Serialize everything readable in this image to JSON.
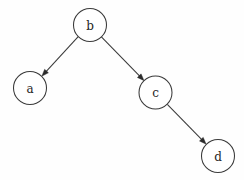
{
  "diagram": {
    "type": "directed-tree",
    "canvas": {
      "width": 244,
      "height": 180,
      "background": "#fefefe"
    },
    "style": {
      "node_fill": "#ffffff",
      "node_stroke": "#3a3a3a",
      "edge_stroke": "#3a3a3a",
      "label_color": "#1e1e1e",
      "node_radius": 16.5,
      "stroke_width": 1.05
    },
    "nodes": [
      {
        "id": "b",
        "label": "b",
        "cx": 90,
        "cy": 25,
        "r": 16.5,
        "role": "root"
      },
      {
        "id": "a",
        "label": "a",
        "cx": 30,
        "cy": 88,
        "r": 16.5,
        "role": "leaf"
      },
      {
        "id": "c",
        "label": "c",
        "cx": 155.5,
        "cy": 92.5,
        "r": 16.5,
        "role": "internal"
      },
      {
        "id": "d",
        "label": "d",
        "cx": 218,
        "cy": 156,
        "r": 16.5,
        "role": "leaf"
      }
    ],
    "edges": [
      {
        "id": "b-a",
        "from": "b",
        "to": "a",
        "directed": true,
        "x1": 78.2,
        "y1": 36.6,
        "x2": 41.8,
        "y2": 76.2,
        "arrow": {
          "tip_x": 41.8,
          "tip_y": 76.2,
          "angle_deg": 47.4
        }
      },
      {
        "id": "b-c",
        "from": "b",
        "to": "c",
        "directed": true,
        "x1": 101.4,
        "y1": 36.8,
        "x2": 144.1,
        "y2": 80.7,
        "arrow": {
          "tip_x": 144.1,
          "tip_y": 80.7,
          "angle_deg": 45.8
        }
      },
      {
        "id": "c-d",
        "from": "c",
        "to": "d",
        "directed": true,
        "x1": 167.3,
        "y1": 104.3,
        "x2": 206.2,
        "y2": 144.2,
        "arrow": {
          "tip_x": 206.2,
          "tip_y": 144.2,
          "angle_deg": 45.7
        }
      }
    ]
  }
}
